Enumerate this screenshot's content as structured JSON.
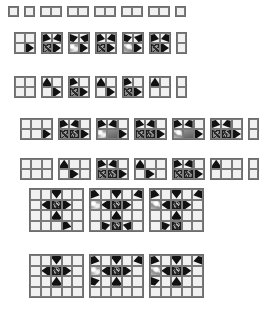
{
  "figure": {
    "type": "pattern-tiling-diagram",
    "background_color": "#ffffff",
    "cell_fill_color": "#f1f1f1",
    "cell_border_color": "#6d6d6d",
    "motif_dark_color": "#111111",
    "motif_grey_color": "#8f8f8f",
    "motif_highlight_color": "#ffffff",
    "cell_size_px": 11,
    "bands": [
      {
        "name": "band-1-singles",
        "row_label": "1x1 and 1x2 fragments",
        "top": 6,
        "left": 8,
        "grid_rows": 1,
        "items": [
          {
            "cols": 1,
            "rows": 1,
            "cells": [
              "plain"
            ]
          },
          {
            "cols": 1,
            "rows": 1,
            "cells": [
              "plain"
            ]
          },
          {
            "cols": 2,
            "rows": 1,
            "cells": [
              "plain",
              "plain"
            ]
          },
          {
            "cols": 2,
            "rows": 1,
            "cells": [
              "plain",
              "plain"
            ]
          },
          {
            "cols": 2,
            "rows": 1,
            "cells": [
              "plain",
              "plain"
            ]
          },
          {
            "cols": 2,
            "rows": 1,
            "cells": [
              "plain",
              "plain"
            ]
          },
          {
            "cols": 2,
            "rows": 1,
            "cells": [
              "plain",
              "plain"
            ]
          },
          {
            "cols": 1,
            "rows": 1,
            "cells": [
              "plain"
            ]
          }
        ]
      },
      {
        "name": "band-2-pairs-upper",
        "row_label": "2x2 fragments, upper variation row",
        "top": 32,
        "left": 14,
        "grid_rows": 2,
        "items": [
          {
            "cols": 2,
            "rows": 2,
            "cells": [
              "plain",
              "plain",
              "plain",
              "lobe-r"
            ]
          },
          {
            "cols": 2,
            "rows": 2,
            "cells": [
              "half-dr",
              "half-dl",
              "ros",
              "lobe-r"
            ]
          },
          {
            "cols": 2,
            "rows": 2,
            "cells": [
              "half-ur",
              "half-ul",
              "sky",
              "lobe-r"
            ]
          },
          {
            "cols": 2,
            "rows": 2,
            "cells": [
              "half-dr",
              "half-dl",
              "ros",
              "lobe-r"
            ]
          },
          {
            "cols": 2,
            "rows": 2,
            "cells": [
              "half-ur",
              "half-ul",
              "sky2",
              "lobe-r"
            ]
          },
          {
            "cols": 2,
            "rows": 2,
            "cells": [
              "half-dr",
              "half-dl",
              "ros",
              "lobe-r"
            ]
          },
          {
            "cols": 1,
            "rows": 2,
            "cells": [
              "plain",
              "plain"
            ]
          }
        ]
      },
      {
        "name": "band-3-pairs-lower",
        "row_label": "2x2 fragments, lower variation row",
        "top": 76,
        "left": 14,
        "grid_rows": 2,
        "items": [
          {
            "cols": 2,
            "rows": 2,
            "cells": [
              "plain",
              "plain",
              "plain",
              "plain"
            ]
          },
          {
            "cols": 2,
            "rows": 2,
            "cells": [
              "lobe-u",
              "plain",
              "plain",
              "lobe-r"
            ]
          },
          {
            "cols": 2,
            "rows": 2,
            "cells": [
              "half-dr",
              "plain",
              "ros",
              "lobe-r"
            ]
          },
          {
            "cols": 2,
            "rows": 2,
            "cells": [
              "lobe-u",
              "plain",
              "plain",
              "lobe-r"
            ]
          },
          {
            "cols": 2,
            "rows": 2,
            "cells": [
              "half-dr",
              "plain",
              "ros",
              "lobe-r"
            ]
          },
          {
            "cols": 2,
            "rows": 2,
            "cells": [
              "lobe-u",
              "plain",
              "plain",
              "plain"
            ]
          },
          {
            "cols": 1,
            "rows": 2,
            "cells": [
              "plain",
              "plain"
            ]
          }
        ]
      },
      {
        "name": "band-4-triples-upper",
        "row_label": "3x2 fragments, upper variation row",
        "top": 118,
        "left": 20,
        "grid_rows": 2,
        "items": [
          {
            "cols": 3,
            "rows": 2,
            "cells": [
              "plain",
              "plain",
              "plain",
              "plain",
              "plain",
              "lobe-r"
            ]
          },
          {
            "cols": 3,
            "rows": 2,
            "cells": [
              "half-dr",
              "half-dl",
              "plain",
              "ros",
              "ros",
              "lobe-r"
            ]
          },
          {
            "cols": 3,
            "rows": 2,
            "cells": [
              "half-dr",
              "half-dl",
              "plain",
              "sky",
              "grey",
              "lobe-r"
            ]
          },
          {
            "cols": 3,
            "rows": 2,
            "cells": [
              "half-dr",
              "half-dl",
              "plain",
              "ros",
              "ros",
              "lobe-r"
            ]
          },
          {
            "cols": 3,
            "rows": 2,
            "cells": [
              "half-dr",
              "half-dl",
              "plain",
              "sky2",
              "grey",
              "lobe-r"
            ]
          },
          {
            "cols": 3,
            "rows": 2,
            "cells": [
              "half-dr",
              "half-dl",
              "plain",
              "ros",
              "ros",
              "lobe-r"
            ]
          },
          {
            "cols": 1,
            "rows": 2,
            "cells": [
              "plain",
              "plain"
            ]
          }
        ]
      },
      {
        "name": "band-5-triples-lower",
        "row_label": "3x2 fragments, lower variation row",
        "top": 158,
        "left": 20,
        "grid_rows": 2,
        "items": [
          {
            "cols": 3,
            "rows": 2,
            "cells": [
              "plain",
              "plain",
              "plain",
              "plain",
              "plain",
              "plain"
            ]
          },
          {
            "cols": 3,
            "rows": 2,
            "cells": [
              "lobe-u",
              "plain",
              "plain",
              "plain",
              "lobe-r",
              "plain"
            ]
          },
          {
            "cols": 3,
            "rows": 2,
            "cells": [
              "half-dr",
              "half-dl",
              "plain",
              "ros",
              "ros",
              "lobe-r"
            ]
          },
          {
            "cols": 3,
            "rows": 2,
            "cells": [
              "lobe-u",
              "plain",
              "plain",
              "plain",
              "lobe-r",
              "plain"
            ]
          },
          {
            "cols": 3,
            "rows": 2,
            "cells": [
              "half-dr",
              "half-dl",
              "plain",
              "ros",
              "ros",
              "lobe-r"
            ]
          },
          {
            "cols": 3,
            "rows": 2,
            "cells": [
              "lobe-u",
              "plain",
              "plain",
              "plain",
              "plain",
              "plain"
            ]
          },
          {
            "cols": 1,
            "rows": 2,
            "cells": [
              "plain",
              "plain"
            ]
          }
        ]
      },
      {
        "name": "band-6-large-upper",
        "row_label": "5x4 full-motif grids, upper row",
        "top": 188,
        "left": 29,
        "grid_rows": 4,
        "items": [
          {
            "cols": 5,
            "rows": 4,
            "cells": [
              "plain",
              "plain",
              "lobe-d",
              "plain",
              "plain",
              "plain",
              "lobe-l",
              "ros",
              "lobe-r",
              "plain",
              "plain",
              "plain",
              "lobe-u",
              "plain",
              "plain",
              "plain",
              "plain",
              "plain",
              "half-dr",
              "plain"
            ]
          },
          {
            "cols": 5,
            "rows": 4,
            "cells": [
              "half-dr",
              "plain",
              "lobe-d",
              "plain",
              "half-dl",
              "sky",
              "lobe-l",
              "ros",
              "lobe-r",
              "plain",
              "plain",
              "plain",
              "lobe-u",
              "plain",
              "plain",
              "plain",
              "half-ur",
              "ros",
              "half-ul",
              "plain"
            ]
          },
          {
            "cols": 5,
            "rows": 4,
            "cells": [
              "half-dr",
              "plain",
              "lobe-d",
              "plain",
              "half-dl",
              "sky2",
              "lobe-l",
              "ros",
              "lobe-r",
              "plain",
              "plain",
              "plain",
              "lobe-u",
              "plain",
              "plain",
              "plain",
              "half-ur",
              "ros",
              "plain",
              "plain"
            ]
          }
        ]
      },
      {
        "name": "band-7-large-lower",
        "row_label": "5x4 full-motif grids, lower row",
        "top": 254,
        "left": 29,
        "grid_rows": 4,
        "items": [
          {
            "cols": 5,
            "rows": 4,
            "cells": [
              "plain",
              "plain",
              "lobe-d",
              "plain",
              "plain",
              "plain",
              "lobe-l",
              "ros",
              "lobe-r",
              "plain",
              "plain",
              "plain",
              "lobe-u",
              "plain",
              "plain",
              "plain",
              "plain",
              "plain",
              "plain",
              "plain"
            ]
          },
          {
            "cols": 5,
            "rows": 4,
            "cells": [
              "half-dr",
              "plain",
              "lobe-d",
              "plain",
              "half-dl",
              "sky",
              "lobe-l",
              "ros",
              "lobe-r",
              "plain",
              "half-ur",
              "plain",
              "lobe-u",
              "plain",
              "plain",
              "plain",
              "plain",
              "plain",
              "plain",
              "plain"
            ]
          },
          {
            "cols": 5,
            "rows": 4,
            "cells": [
              "half-dr",
              "plain",
              "lobe-d",
              "plain",
              "half-dl",
              "sky2",
              "lobe-l",
              "ros",
              "lobe-r",
              "plain",
              "half-ur",
              "plain",
              "lobe-u",
              "plain",
              "plain",
              "plain",
              "plain",
              "plain",
              "plain",
              "plain"
            ]
          }
        ]
      }
    ]
  }
}
